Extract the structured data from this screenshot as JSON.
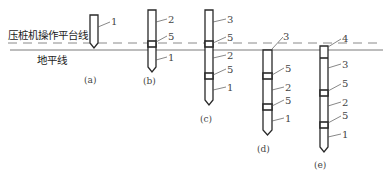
{
  "diagram": {
    "title_lines": {
      "platform_line_label": "压桩机操作平台线",
      "ground_line_label": "地平线"
    },
    "colors": {
      "stroke": "#2a2a2a",
      "dashed_line": "#888888",
      "ground_line": "#777777",
      "text": "#333333"
    },
    "piles": [
      {
        "id": "a",
        "caption": "(a)",
        "labels": [
          "1"
        ]
      },
      {
        "id": "b",
        "caption": "(b)",
        "labels": [
          "2",
          "5",
          "1"
        ]
      },
      {
        "id": "c",
        "caption": "(c)",
        "labels": [
          "3",
          "5",
          "2",
          "5",
          "1"
        ]
      },
      {
        "id": "d",
        "caption": "(d)",
        "labels": [
          "3",
          "5",
          "2",
          "5",
          "1"
        ]
      },
      {
        "id": "e",
        "caption": "(e)",
        "labels": [
          "4",
          "3",
          "5",
          "2",
          "5",
          "1"
        ]
      }
    ]
  }
}
